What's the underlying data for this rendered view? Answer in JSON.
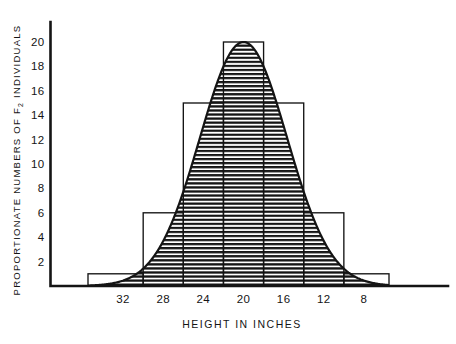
{
  "chart_data": {
    "type": "bar",
    "title": "",
    "subtitle": "",
    "xlabel": "HEIGHT IN INCHES",
    "ylabel_parts": [
      "PROPORTIONATE NUMBERS OF F",
      "2",
      " INDIVIDUALS"
    ],
    "ylabel": "PROPORTIONATE NUMBERS OF F2 INDIVIDUALS",
    "categories": [
      "34",
      "32",
      "28",
      "24",
      "20",
      "16",
      "12",
      "8",
      "6"
    ],
    "x_tick_labels": [
      "32",
      "28",
      "24",
      "20",
      "16",
      "12",
      "8"
    ],
    "x_tick_positions": [
      32,
      28,
      24,
      20,
      16,
      12,
      8
    ],
    "values": [
      1,
      1,
      6,
      15,
      20,
      15,
      6,
      1,
      1
    ],
    "bar_values": [
      1,
      6,
      15,
      20,
      15,
      6,
      1
    ],
    "y_tick_labels": [
      "20",
      "18",
      "16",
      "14",
      "12",
      "10",
      "8",
      "6",
      "4",
      "2"
    ],
    "y_tick_values": [
      20,
      18,
      16,
      14,
      12,
      10,
      8,
      6,
      4,
      2
    ],
    "ylim": [
      0,
      21
    ],
    "xlim_inches": [
      35.5,
      5.5
    ],
    "x_axis_direction": "descending",
    "grid": false,
    "legend": "none",
    "overlay": {
      "type": "normal-curve",
      "mean_inches": 20,
      "peak_value": 20,
      "fill": "horizontal-line-hatching"
    },
    "colors": {
      "ink": "#141414",
      "background": "#ffffff",
      "hatch": "#141414"
    }
  },
  "figure": {
    "caption": ""
  }
}
